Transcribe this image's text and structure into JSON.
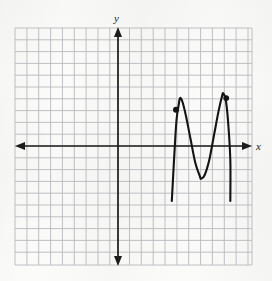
{
  "figure": {
    "kind": "cartesian-grid-graph",
    "background_color": "#fbfbfa",
    "grid_color": "#b9b9bd",
    "axis_color": "#1d1d1d",
    "curve_color": "#141414"
  },
  "axes": {
    "x_label": "x",
    "y_label": "y",
    "origin_px": {
      "x": 118,
      "y": 146
    },
    "cell_px": 11.7,
    "grid_rect_px": {
      "left": 15,
      "top": 28,
      "right": 252,
      "bottom": 265
    },
    "columns": 20,
    "rows": 20,
    "x_range_cells": [
      -8.8,
      11.5
    ],
    "y_range_cells": [
      -10.2,
      10.1
    ],
    "tick_labels": [],
    "grid_visible": true,
    "arrows": [
      "left",
      "right",
      "up",
      "down"
    ]
  },
  "chart_data": {
    "type": "line",
    "title": "",
    "xlabel": "x",
    "ylabel": "y",
    "grid": true,
    "legend": null,
    "xlim": [
      -8.8,
      11.5
    ],
    "ylim": [
      -10.2,
      10.1
    ],
    "series": [
      {
        "name": "curve",
        "points_cells": [
          {
            "x": 4.6,
            "y": -4.7
          },
          {
            "x": 4.8,
            "y": -1.0
          },
          {
            "x": 5.0,
            "y": 2.2
          },
          {
            "x": 5.2,
            "y": 3.6
          },
          {
            "x": 5.3,
            "y": 4.1
          },
          {
            "x": 5.5,
            "y": 3.8
          },
          {
            "x": 5.8,
            "y": 2.6
          },
          {
            "x": 6.2,
            "y": 0.6
          },
          {
            "x": 6.6,
            "y": -1.4
          },
          {
            "x": 7.0,
            "y": -2.6
          },
          {
            "x": 7.1,
            "y": -2.8
          },
          {
            "x": 7.4,
            "y": -2.5
          },
          {
            "x": 7.8,
            "y": -1.2
          },
          {
            "x": 8.2,
            "y": 0.9
          },
          {
            "x": 8.6,
            "y": 3.0
          },
          {
            "x": 8.9,
            "y": 4.3
          },
          {
            "x": 9.0,
            "y": 4.5
          },
          {
            "x": 9.2,
            "y": 4.0
          },
          {
            "x": 9.4,
            "y": 2.2
          },
          {
            "x": 9.6,
            "y": -1.2
          },
          {
            "x": 9.6,
            "y": -4.7
          }
        ],
        "markers_cells": [
          {
            "x": 4.95,
            "y": 3.1
          },
          {
            "x": 9.25,
            "y": 4.1
          }
        ],
        "peaks_cells": [
          {
            "x": 5.3,
            "y": 4.1
          },
          {
            "x": 9.0,
            "y": 4.5
          }
        ],
        "valley_cells": [
          {
            "x": 7.1,
            "y": -2.8
          }
        ],
        "endpoints_cells": [
          {
            "x": 4.6,
            "y": -4.7
          },
          {
            "x": 9.6,
            "y": -4.7
          }
        ]
      }
    ]
  }
}
